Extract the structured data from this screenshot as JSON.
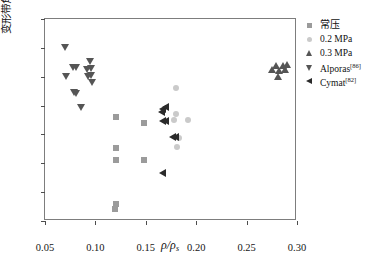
{
  "chart_data": {
    "type": "scatter",
    "title": "",
    "xlabel": "ρ/ρs",
    "ylabel": "变形带角度/(°)",
    "xlim": [
      0.05,
      0.3
    ],
    "ylim": [
      0,
      35
    ],
    "xticks": [
      "0.05",
      "0.10",
      "0.15",
      "0.20",
      "0.25",
      "0.30"
    ],
    "yticks": [
      "0",
      "5",
      "10",
      "15",
      "20",
      "25",
      "30",
      "35"
    ],
    "grid": false,
    "legend_position": "outside-right-top",
    "series": [
      {
        "name": "常压",
        "marker": "square",
        "color": "#9b9b9b",
        "points": [
          {
            "x": 0.12,
            "y": 18.0
          },
          {
            "x": 0.12,
            "y": 12.6
          },
          {
            "x": 0.12,
            "y": 10.5
          },
          {
            "x": 0.12,
            "y": 3.0
          },
          {
            "x": 0.119,
            "y": 2.0
          },
          {
            "x": 0.148,
            "y": 17.0
          },
          {
            "x": 0.148,
            "y": 10.5
          }
        ]
      },
      {
        "name": "0.2 MPa",
        "marker": "circle",
        "color": "#cacaca",
        "points": [
          {
            "x": 0.18,
            "y": 23.0
          },
          {
            "x": 0.18,
            "y": 18.6
          },
          {
            "x": 0.178,
            "y": 17.5
          },
          {
            "x": 0.192,
            "y": 17.5
          },
          {
            "x": 0.183,
            "y": 14.3
          },
          {
            "x": 0.181,
            "y": 12.8
          }
        ]
      },
      {
        "name": "0.3 MPa",
        "marker": "triangle-up",
        "color": "#555555",
        "points": [
          {
            "x": 0.275,
            "y": 26.3
          },
          {
            "x": 0.279,
            "y": 27.0
          },
          {
            "x": 0.282,
            "y": 26.2
          },
          {
            "x": 0.281,
            "y": 25.2
          },
          {
            "x": 0.286,
            "y": 27.0
          },
          {
            "x": 0.29,
            "y": 27.2
          },
          {
            "x": 0.288,
            "y": 26.3
          }
        ]
      },
      {
        "name": "Alporas[86]",
        "marker": "triangle-down",
        "color": "#555555",
        "points": [
          {
            "x": 0.0695,
            "y": 30.1
          },
          {
            "x": 0.0705,
            "y": 25.1
          },
          {
            "x": 0.0775,
            "y": 26.6
          },
          {
            "x": 0.0805,
            "y": 26.6
          },
          {
            "x": 0.0785,
            "y": 22.4
          },
          {
            "x": 0.0805,
            "y": 22.1
          },
          {
            "x": 0.0855,
            "y": 19.7
          },
          {
            "x": 0.095,
            "y": 27.8
          },
          {
            "x": 0.096,
            "y": 26.5
          },
          {
            "x": 0.0955,
            "y": 25.3
          },
          {
            "x": 0.097,
            "y": 24.0
          },
          {
            "x": 0.092,
            "y": 26.4
          },
          {
            "x": 0.093,
            "y": 25.2
          }
        ]
      },
      {
        "name": "Cymat[82]",
        "marker": "triangle-left",
        "color": "#2b2b2b",
        "points": [
          {
            "x": 0.166,
            "y": 19.4
          },
          {
            "x": 0.169,
            "y": 19.8
          },
          {
            "x": 0.1655,
            "y": 18.8
          },
          {
            "x": 0.166,
            "y": 17.4
          },
          {
            "x": 0.169,
            "y": 17.4
          },
          {
            "x": 0.1755,
            "y": 14.5
          },
          {
            "x": 0.179,
            "y": 14.5
          },
          {
            "x": 0.1665,
            "y": 8.4
          }
        ]
      }
    ]
  },
  "legend": {
    "items": [
      {
        "label": "常压",
        "marker": "square-icon",
        "color": "#9b9b9b",
        "cjk": true,
        "ref": ""
      },
      {
        "label": "0.2 MPa",
        "marker": "circle-icon",
        "color": "#cacaca",
        "cjk": false,
        "ref": ""
      },
      {
        "label": "0.3 MPa",
        "marker": "triangle-up-icon",
        "color": "#555555",
        "cjk": false,
        "ref": ""
      },
      {
        "label": "Alporas",
        "marker": "triangle-down-icon",
        "color": "#555555",
        "cjk": false,
        "ref": "[86]"
      },
      {
        "label": "Cymat",
        "marker": "triangle-left-icon",
        "color": "#2b2b2b",
        "cjk": false,
        "ref": "[82]"
      }
    ]
  }
}
